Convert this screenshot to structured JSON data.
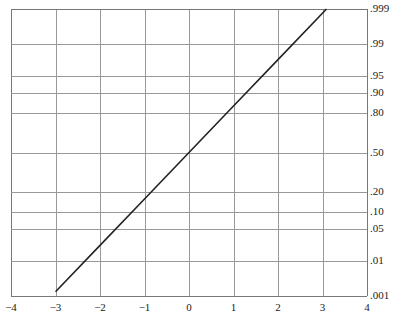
{
  "chart_data": {
    "type": "line",
    "title": "",
    "subtitle": "",
    "xlabel": "",
    "ylabel": "",
    "plot_kind": "normal-probability-plot",
    "grid": true,
    "legend": null,
    "background_color": "#ffffff",
    "grid_color": "#999999",
    "axis_color": "#777777",
    "line_color": "#222222",
    "text_color": "#1a1a1a",
    "x_axis": {
      "label": "",
      "position": "bottom",
      "range": [
        -4,
        4
      ],
      "tick_values": [
        -4,
        -3,
        -2,
        -1,
        0,
        1,
        2,
        3,
        4
      ],
      "tick_labels": [
        "−4",
        "−3",
        "−2",
        "−1",
        "0",
        "1",
        "2",
        "3",
        "4"
      ]
    },
    "y_axis": {
      "label": "",
      "position": "right",
      "scale": "probit",
      "range_probability": [
        0.001,
        0.999
      ],
      "range_z": [
        -3.09,
        3.09
      ],
      "tick_values": [
        0.999,
        0.99,
        0.95,
        0.9,
        0.8,
        0.5,
        0.2,
        0.1,
        0.05,
        0.01,
        0.001
      ],
      "tick_labels": [
        ".999",
        ".99",
        ".95",
        ".90",
        ".80",
        ".50",
        ".20",
        ".10",
        ".05",
        ".01",
        ".001"
      ],
      "tick_z_values": [
        3.09,
        2.326,
        1.645,
        1.282,
        0.842,
        0,
        -0.842,
        -1.282,
        -1.645,
        -2.326,
        -3.09
      ]
    },
    "series": [
      {
        "name": "normal reference line",
        "style": "solid",
        "width_px": 1.6,
        "color": "#222222",
        "x": [
          -3.0,
          -2.0,
          -1.0,
          0.0,
          1.0,
          2.0,
          3.09
        ],
        "y_probability": [
          0.00135,
          0.02275,
          0.15866,
          0.5,
          0.84134,
          0.97725,
          0.999
        ],
        "y_z": [
          -3.0,
          -2.0,
          -1.0,
          0.0,
          1.0,
          2.0,
          3.09
        ]
      }
    ],
    "annotations": []
  },
  "geometry": {
    "plot_left": 11,
    "plot_right": 367,
    "plot_top": 9,
    "plot_bottom": 296,
    "z_scale_px_per_unit_x": 44.5,
    "z_scale_px_per_unit_y": 46.44
  }
}
